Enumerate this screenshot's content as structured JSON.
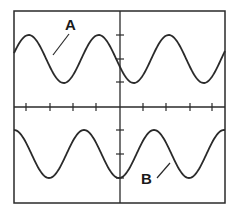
{
  "diagram": {
    "type": "oscilloscope-traces",
    "colors": {
      "stroke": "#2a2a2a",
      "background": "#ffffff"
    },
    "screen": {
      "horizontal_divisions_ticks": 8,
      "vertical_center_ticks": 4
    },
    "traces": [
      {
        "label": "A",
        "position": "upper",
        "shape": "sine",
        "phase_at_left_edge": "zero-crossing rising",
        "cycles_visible": 3
      },
      {
        "label": "B",
        "position": "lower",
        "shape": "sine",
        "phase_at_left_edge": "peak",
        "cycles_visible": 3
      }
    ]
  }
}
